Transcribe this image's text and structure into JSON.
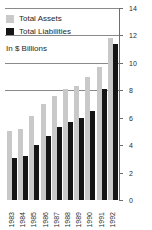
{
  "legend": {
    "position": "top-left",
    "items": [
      {
        "label": "Total Assets",
        "color": "#c9c9c9",
        "key": "assets"
      },
      {
        "label": "Total Liabilities",
        "color": "#151515",
        "key": "liabilities"
      }
    ]
  },
  "units_note": "In $ Billions",
  "axis": {
    "y_ticks": [
      "0",
      "2",
      "4",
      "6",
      "8",
      "10",
      "12",
      "14"
    ],
    "y_tick_values": [
      0,
      2,
      4,
      6,
      8,
      10,
      12,
      14
    ],
    "y_position": "right",
    "gridline_values": [
      8,
      10,
      12,
      14
    ]
  },
  "chart_data": {
    "type": "bar",
    "title": "",
    "subtitle": "In $ Billions",
    "xlabel": "",
    "ylabel": "In $ Billions",
    "ylim": [
      0,
      14
    ],
    "ytick_step": 2,
    "grid": true,
    "grid_axis": "y",
    "legend_position": "top-left",
    "categories": [
      "1983",
      "1984",
      "1985",
      "1986",
      "1987",
      "1988",
      "1989",
      "1990",
      "1991",
      "1992"
    ],
    "series": [
      {
        "name": "Total Assets",
        "color": "#c9c9c9",
        "values": [
          5.0,
          5.2,
          6.1,
          7.0,
          7.6,
          8.1,
          8.3,
          9.0,
          9.7,
          11.8
        ]
      },
      {
        "name": "Total Liabilities",
        "color": "#151515",
        "values": [
          3.1,
          3.2,
          4.0,
          4.7,
          5.3,
          5.7,
          6.0,
          6.5,
          8.1,
          11.4
        ]
      }
    ]
  }
}
